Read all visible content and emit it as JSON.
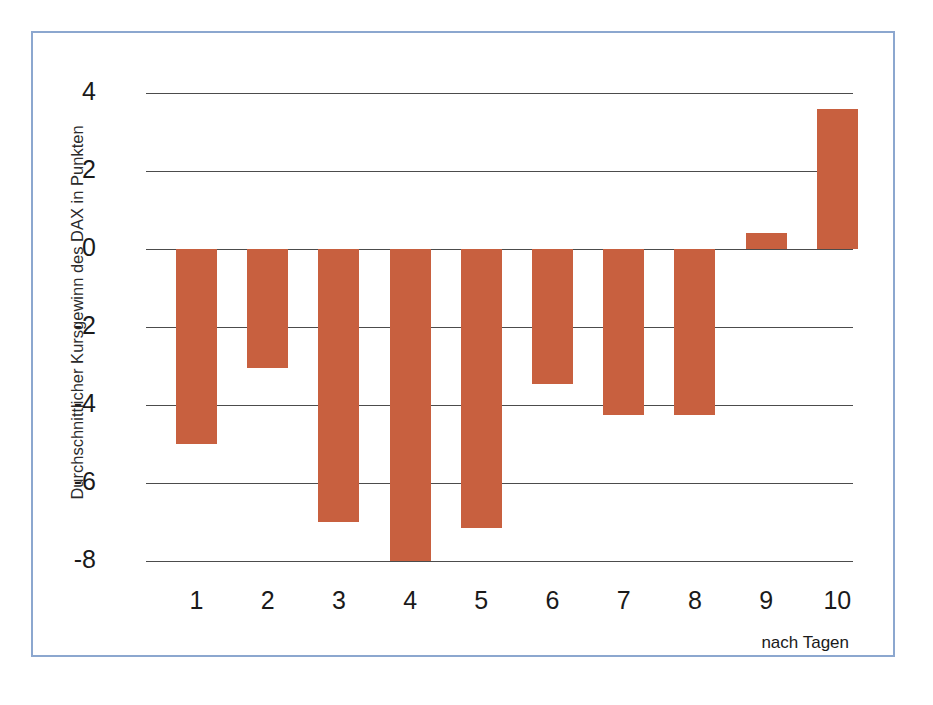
{
  "chart_data": {
    "type": "bar",
    "title": "",
    "subtitle": "",
    "xlabel": "nach Tagen",
    "ylabel": "Durchschnittlicher Kursgewinn des DAX in Punkten",
    "categories": [
      "1",
      "2",
      "3",
      "4",
      "5",
      "6",
      "7",
      "8",
      "9",
      "10"
    ],
    "values": [
      -5.0,
      -3.05,
      -7.0,
      -8.0,
      -7.15,
      -3.45,
      -4.25,
      -4.25,
      0.4,
      3.6
    ],
    "series": [
      {
        "name": "Durchschnittlicher Kursgewinn des DAX in Punkten",
        "values": [
          -5.0,
          -3.05,
          -7.0,
          -8.0,
          -7.15,
          -3.45,
          -4.25,
          -4.25,
          0.4,
          3.6
        ]
      }
    ],
    "ylim": [
      -8,
      4
    ],
    "yticks": [
      4,
      2,
      0,
      -2,
      -4,
      -6,
      -8
    ],
    "ytick_labels": [
      "4",
      "2",
      "0",
      "-2",
      "-4",
      "-6",
      "-8"
    ],
    "xlim": [
      0.5,
      10.5
    ],
    "grid": true,
    "grid_axis": "y",
    "legend": false,
    "legend_position": "none",
    "bar_color": "#c8603f",
    "gridline_color": "#4c4c4c",
    "frame_color": "#8ca7cf",
    "background_color": "#ffffff",
    "annotations": []
  },
  "axes": {
    "y_ticks": [
      {
        "label": "4",
        "value": 4
      },
      {
        "label": "2",
        "value": 2
      },
      {
        "label": "0",
        "value": 0
      },
      {
        "label": "-2",
        "value": -2
      },
      {
        "label": "-4",
        "value": -4
      },
      {
        "label": "-6",
        "value": -6
      },
      {
        "label": "-8",
        "value": -8
      }
    ],
    "x_ticks": [
      {
        "label": "1",
        "value": 1
      },
      {
        "label": "2",
        "value": 2
      },
      {
        "label": "3",
        "value": 3
      },
      {
        "label": "4",
        "value": 4
      },
      {
        "label": "5",
        "value": 5
      },
      {
        "label": "6",
        "value": 6
      },
      {
        "label": "7",
        "value": 7
      },
      {
        "label": "8",
        "value": 8
      },
      {
        "label": "9",
        "value": 9
      },
      {
        "label": "10",
        "value": 10
      }
    ],
    "y_axis_title": "Durchschnittlicher Kursgewinn des DAX in Punkten",
    "x_axis_title": "nach Tagen"
  }
}
